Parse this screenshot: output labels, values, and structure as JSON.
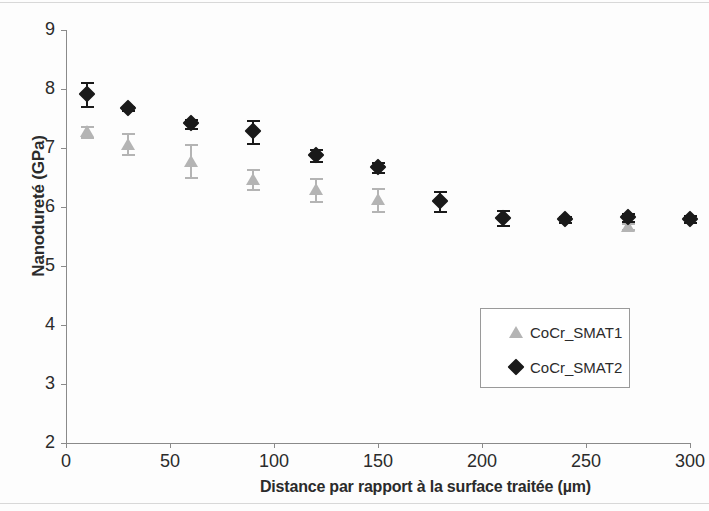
{
  "chart_data": {
    "type": "scatter",
    "title": "",
    "xlabel": "Distance par rapport à la surface traitée (µm)",
    "ylabel": "Nanodureté (GPa)",
    "xlim": [
      0,
      300
    ],
    "ylim": [
      2,
      9
    ],
    "xticks": [
      0,
      50,
      100,
      150,
      200,
      250,
      300
    ],
    "yticks": [
      2,
      3,
      4,
      5,
      6,
      7,
      8,
      9
    ],
    "grid": false,
    "legend_position": "center-right",
    "series": [
      {
        "name": "CoCr_SMAT1",
        "marker": "triangle",
        "color": "#b4b4b4",
        "x": [
          10,
          30,
          60,
          90,
          120,
          150,
          270
        ],
        "values": [
          7.28,
          7.07,
          6.78,
          6.48,
          6.3,
          6.13,
          5.68
        ],
        "errors": [
          0.1,
          0.18,
          0.28,
          0.17,
          0.2,
          0.2,
          0.05
        ]
      },
      {
        "name": "CoCr_SMAT2",
        "marker": "diamond",
        "color": "#1a1a1a",
        "x": [
          10,
          30,
          60,
          90,
          120,
          150,
          180,
          210,
          240,
          270,
          300
        ],
        "values": [
          7.92,
          7.68,
          7.42,
          7.28,
          6.88,
          6.68,
          6.1,
          5.82,
          5.8,
          5.83,
          5.8
        ],
        "errors": [
          0.2,
          0.04,
          0.08,
          0.2,
          0.1,
          0.08,
          0.17,
          0.13,
          0.05,
          0.06,
          0.06
        ]
      }
    ]
  },
  "legend": {
    "entries": [
      {
        "label": "CoCr_SMAT1",
        "marker": "triangle"
      },
      {
        "label": "CoCr_SMAT2",
        "marker": "diamond"
      }
    ]
  }
}
